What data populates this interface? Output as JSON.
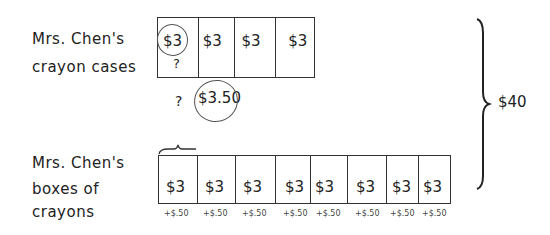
{
  "top_tape": {
    "label_line1": "Mrs. Chen's",
    "label_line2": "crayon cases",
    "cells": [
      "$3",
      "$3",
      "$3",
      "$3"
    ],
    "question": "?"
  },
  "bottom_tape": {
    "label_line1": "Mrs. Chen's",
    "label_line2": "boxes of",
    "label_line3": "crayons",
    "cells": [
      "$3",
      "$3",
      "$3",
      "$3",
      "$3",
      "$3",
      "$3",
      "$3"
    ],
    "increments": [
      "+$.50",
      "+$.50",
      "+$.50",
      "+$.50",
      "+$.50",
      "+$.50",
      "+$.50",
      "+$.50"
    ],
    "question": "?",
    "circled_value": "$3.50"
  },
  "total": "$40"
}
